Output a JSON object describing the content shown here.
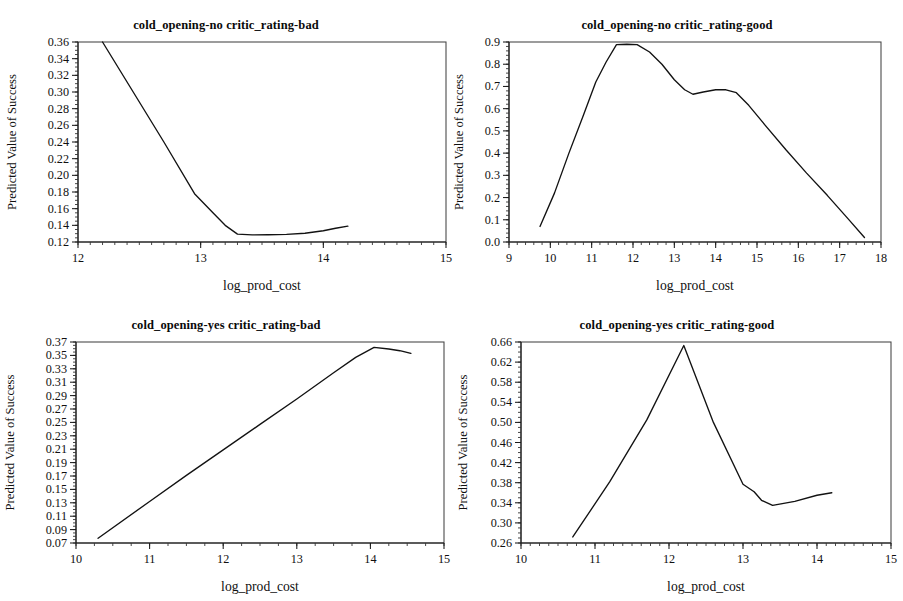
{
  "figure": {
    "width": 903,
    "height": 601,
    "background": "#ffffff",
    "line_color": "#121212",
    "axis_color": "#1a1a1a",
    "rows": 2,
    "cols": 2
  },
  "chart_data": [
    {
      "type": "line",
      "panel_index": 0,
      "title": "cold_opening-no critic_rating-bad",
      "xlabel": "log_prod_cost",
      "ylabel": "Predicted Value of Success",
      "xlim": [
        12,
        15
      ],
      "ylim": [
        0.12,
        0.36
      ],
      "xticks": [
        12,
        13,
        14,
        15
      ],
      "xtick_labels": [
        "12",
        "13",
        "14",
        "15"
      ],
      "yticks": [
        0.12,
        0.14,
        0.16,
        0.18,
        0.2,
        0.22,
        0.24,
        0.26,
        0.28,
        0.3,
        0.32,
        0.34,
        0.36
      ],
      "ytick_labels": [
        "0.12",
        "0.14",
        "0.16",
        "0.18",
        "0.20",
        "0.22",
        "0.24",
        "0.26",
        "0.28",
        "0.30",
        "0.32",
        "0.34",
        "0.36"
      ],
      "x_minor_step": 0.1,
      "y_minor_step": 0.005,
      "grid": false,
      "legend": null,
      "x": [
        12.2,
        12.45,
        12.7,
        12.95,
        13.1,
        13.2,
        13.3,
        13.42,
        13.55,
        13.7,
        13.85,
        14.0,
        14.1,
        14.2
      ],
      "y": [
        0.36,
        0.3,
        0.24,
        0.178,
        0.155,
        0.14,
        0.1295,
        0.1285,
        0.1287,
        0.1292,
        0.1305,
        0.1335,
        0.1365,
        0.139
      ]
    },
    {
      "type": "line",
      "panel_index": 1,
      "title": "cold_opening-no critic_rating-good",
      "xlabel": "log_prod_cost",
      "ylabel": "Predicted Value of Success",
      "xlim": [
        9,
        18
      ],
      "ylim": [
        0.0,
        0.9
      ],
      "xticks": [
        9,
        10,
        11,
        12,
        13,
        14,
        15,
        16,
        17,
        18
      ],
      "xtick_labels": [
        "9",
        "10",
        "11",
        "12",
        "13",
        "14",
        "15",
        "16",
        "17",
        "18"
      ],
      "yticks": [
        0.0,
        0.1,
        0.2,
        0.3,
        0.4,
        0.5,
        0.6,
        0.7,
        0.8,
        0.9
      ],
      "ytick_labels": [
        "0.0",
        "0.1",
        "0.2",
        "0.3",
        "0.4",
        "0.5",
        "0.6",
        "0.7",
        "0.8",
        "0.9"
      ],
      "x_minor_step": 0.2,
      "y_minor_step": 0.02,
      "grid": false,
      "legend": null,
      "x": [
        9.75,
        10.1,
        10.45,
        10.8,
        11.1,
        11.35,
        11.6,
        11.85,
        12.1,
        12.4,
        12.7,
        13.0,
        13.25,
        13.45,
        13.7,
        14.0,
        14.25,
        14.5,
        14.8,
        15.2,
        15.7,
        16.2,
        16.7,
        17.2,
        17.6
      ],
      "y": [
        0.07,
        0.22,
        0.4,
        0.57,
        0.72,
        0.81,
        0.888,
        0.89,
        0.888,
        0.855,
        0.8,
        0.73,
        0.685,
        0.665,
        0.675,
        0.685,
        0.685,
        0.672,
        0.615,
        0.525,
        0.415,
        0.31,
        0.21,
        0.105,
        0.02
      ]
    },
    {
      "type": "line",
      "panel_index": 2,
      "title": "cold_opening-yes critic_rating-bad",
      "xlabel": "log_prod_cost",
      "ylabel": "Predicted Value of Success",
      "xlim": [
        10,
        15
      ],
      "ylim": [
        0.07,
        0.37
      ],
      "xticks": [
        10,
        11,
        12,
        13,
        14,
        15
      ],
      "xtick_labels": [
        "10",
        "11",
        "12",
        "13",
        "14",
        "15"
      ],
      "yticks": [
        0.07,
        0.09,
        0.11,
        0.13,
        0.15,
        0.17,
        0.19,
        0.21,
        0.23,
        0.25,
        0.27,
        0.29,
        0.31,
        0.33,
        0.35,
        0.37
      ],
      "ytick_labels": [
        "0.07",
        "0.09",
        "0.11",
        "0.13",
        "0.15",
        "0.17",
        "0.19",
        "0.21",
        "0.23",
        "0.25",
        "0.27",
        "0.29",
        "0.31",
        "0.33",
        "0.35",
        "0.37"
      ],
      "x_minor_step": 0.25,
      "y_minor_step": 0.005,
      "grid": false,
      "legend": null,
      "x": [
        10.3,
        11.0,
        11.5,
        12.0,
        12.5,
        13.0,
        13.5,
        13.8,
        14.05,
        14.25,
        14.4,
        14.55
      ],
      "y": [
        0.077,
        0.132,
        0.171,
        0.209,
        0.247,
        0.285,
        0.324,
        0.347,
        0.362,
        0.3595,
        0.357,
        0.353
      ]
    },
    {
      "type": "line",
      "panel_index": 3,
      "title": "cold_opening-yes critic_rating-good",
      "xlabel": "log_prod_cost",
      "ylabel": "Predicted Value of Success",
      "xlim": [
        10,
        15
      ],
      "ylim": [
        0.26,
        0.66
      ],
      "xticks": [
        10,
        11,
        12,
        13,
        14,
        15
      ],
      "xtick_labels": [
        "10",
        "11",
        "12",
        "13",
        "14",
        "15"
      ],
      "yticks": [
        0.26,
        0.3,
        0.34,
        0.38,
        0.42,
        0.46,
        0.5,
        0.54,
        0.58,
        0.62,
        0.66
      ],
      "ytick_labels": [
        "0.26",
        "0.30",
        "0.34",
        "0.38",
        "0.42",
        "0.46",
        "0.50",
        "0.54",
        "0.58",
        "0.62",
        "0.66"
      ],
      "x_minor_step": 0.125,
      "y_minor_step": 0.01,
      "grid": false,
      "legend": null,
      "x": [
        10.7,
        11.2,
        11.7,
        12.2,
        12.6,
        13.0,
        13.15,
        13.25,
        13.4,
        13.7,
        14.0,
        14.2
      ],
      "y": [
        0.272,
        0.382,
        0.505,
        0.653,
        0.5,
        0.377,
        0.362,
        0.345,
        0.335,
        0.343,
        0.355,
        0.36
      ]
    }
  ]
}
